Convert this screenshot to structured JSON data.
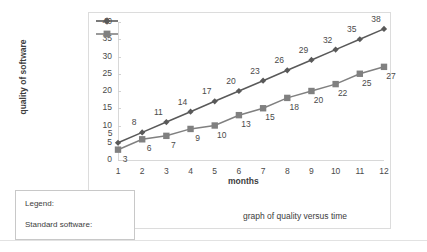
{
  "chart_data": {
    "type": "line",
    "title": "",
    "caption": "graph of quality versus time",
    "xlabel": "months",
    "ylabel": "quality of software",
    "categories": [
      1,
      2,
      3,
      4,
      5,
      6,
      7,
      8,
      9,
      10,
      11,
      12
    ],
    "x_tick_labels": [
      "1",
      "2",
      "3",
      "4",
      "5",
      "6",
      "7",
      "8",
      "9",
      "10",
      "11",
      "12"
    ],
    "y_tick_labels": [
      "0",
      "5",
      "10",
      "15",
      "20",
      "25",
      "30",
      "35",
      "40"
    ],
    "y_ticks": [
      0,
      5,
      10,
      15,
      20,
      25,
      30,
      35,
      40
    ],
    "ylim": [
      0,
      40
    ],
    "xlim": [
      1,
      12
    ],
    "grid": false,
    "legend_position": "external-box-bottom-left",
    "series": [
      {
        "name": "Legend:",
        "marker": "diamond",
        "color": "#595959",
        "values": [
          5,
          8,
          11,
          14,
          17,
          20,
          23,
          26,
          29,
          32,
          35,
          38
        ],
        "data_labels": [
          "5",
          "8",
          "11",
          "14",
          "17",
          "20",
          "23",
          "26",
          "29",
          "32",
          "35",
          "38"
        ]
      },
      {
        "name": "Standard software:",
        "marker": "square",
        "color": "#808080",
        "values": [
          3,
          6,
          7,
          9,
          10,
          13,
          15,
          18,
          20,
          22,
          25,
          27
        ],
        "data_labels": [
          "3",
          "6",
          "7",
          "9",
          "10",
          "13",
          "15",
          "18",
          "20",
          "22",
          "25",
          "27"
        ]
      }
    ]
  },
  "legend": {
    "title": "Legend:",
    "standard_label": "Standard software:"
  },
  "colors": {
    "series_upper": "#595959",
    "series_lower": "#808080",
    "frame": "#dcdcdc",
    "text": "#3c3c3c"
  }
}
